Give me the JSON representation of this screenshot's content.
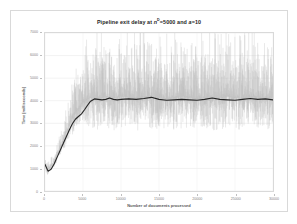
{
  "chart_data": {
    "type": "line",
    "title_parts": {
      "prefix": "Pipeline exit delay at ",
      "var1": "n",
      "var1_sup": "D",
      "mid": "=5000 and ",
      "var2": "a",
      "suffix": "=10"
    },
    "xlabel": "Number of documents processed",
    "ylabel": "Time [milliseconds]",
    "xlim": [
      0,
      30000
    ],
    "ylim": [
      0,
      7000
    ],
    "xticks": [
      0,
      5000,
      10000,
      15000,
      20000,
      25000,
      30000
    ],
    "xtick_labels": [
      "0",
      "5000",
      "10000",
      "15000",
      "20000",
      "25000",
      "30000"
    ],
    "yticks": [
      0,
      1000,
      2000,
      3000,
      4000,
      5000,
      6000,
      7000
    ],
    "ytick_labels": [
      "0",
      "1000",
      "2000",
      "3000",
      "4000",
      "5000",
      "6000",
      "7000"
    ],
    "grid": true,
    "grid_orientation": "both",
    "legend": false,
    "series": [
      {
        "name": "raw delay",
        "color": "#bfbfbf",
        "style": "noisy-line",
        "x": [
          0,
          300,
          600,
          900,
          1200,
          1500,
          1800,
          2100,
          2400,
          2700,
          3000,
          3300,
          3600,
          3900,
          4200,
          4500,
          4800,
          5100,
          5400,
          5700,
          6000,
          6500,
          7000,
          7500,
          8000,
          8500,
          9000,
          9500,
          10000,
          11000,
          12000,
          13000,
          14000,
          15000,
          16000,
          17000,
          18000,
          19000,
          20000,
          21000,
          22000,
          23000,
          24000,
          25000,
          26000,
          27000,
          28000,
          29000,
          30000
        ],
        "values": [
          1200,
          900,
          1050,
          1150,
          1300,
          1500,
          1750,
          2000,
          2250,
          2500,
          2750,
          3000,
          3200,
          3400,
          3550,
          3700,
          3850,
          3950,
          4050,
          4100,
          4150,
          4150,
          4100,
          4150,
          4200,
          4150,
          4100,
          4150,
          4200,
          4150,
          4100,
          4150,
          4200,
          4150,
          4100,
          4150,
          4200,
          4150,
          4100,
          4150,
          4100,
          4150,
          4200,
          4150,
          4100,
          4150,
          4200,
          4100,
          4150
        ],
        "noise_amplitude_max": 2600,
        "noise_amplitude_min": 1200
      },
      {
        "name": "moving average",
        "color": "#262626",
        "style": "smooth-line",
        "x": [
          0,
          400,
          800,
          1200,
          1600,
          2000,
          2400,
          2800,
          3200,
          3600,
          4000,
          4400,
          4800,
          5200,
          5600,
          6000,
          6500,
          7000,
          7500,
          8000,
          8500,
          9000,
          9500,
          10000,
          11000,
          12000,
          13000,
          14000,
          15000,
          16000,
          17000,
          18000,
          19000,
          20000,
          21000,
          22000,
          23000,
          24000,
          25000,
          26000,
          27000,
          28000,
          29000,
          30000
        ],
        "values": [
          1180,
          880,
          960,
          1200,
          1500,
          1800,
          2100,
          2400,
          2700,
          2980,
          3180,
          3300,
          3420,
          3600,
          3800,
          3980,
          4080,
          4060,
          4040,
          4060,
          4120,
          4060,
          4040,
          4060,
          4080,
          4060,
          4100,
          4150,
          4060,
          4020,
          4040,
          4060,
          4040,
          4020,
          4060,
          4120,
          4060,
          4040,
          4020,
          4060,
          4100,
          4060,
          4080,
          4040
        ]
      }
    ]
  },
  "colors": {
    "raw": "#bfbfbf",
    "average": "#262626",
    "grid": "#e4e4e4",
    "border": "#d9d9d9",
    "tick_text": "#7f7f7f",
    "axis_title": "#595959",
    "title": "#262626"
  }
}
